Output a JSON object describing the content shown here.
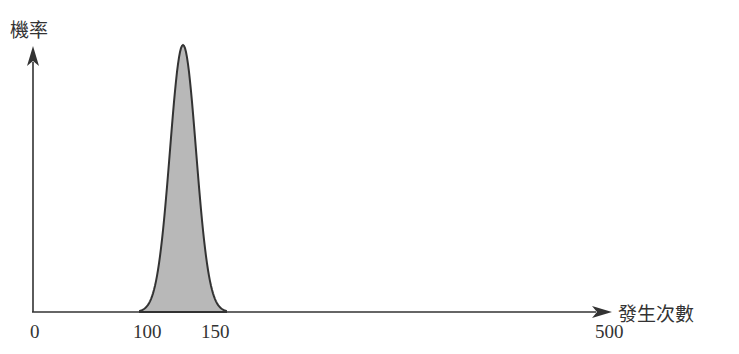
{
  "chart_data": {
    "type": "area",
    "title": "",
    "xlabel": "發生次數",
    "ylabel": "機率",
    "x_ticks": [
      "0",
      "100",
      "150",
      "500"
    ],
    "xlim": [
      0,
      500
    ],
    "grid": false,
    "legend": null,
    "series": [
      {
        "name": "機率分布",
        "shape": "bell-shaped (approx. normal)",
        "peak_x": 125,
        "support": [
          100,
          150
        ],
        "fill": "#b8b8b8",
        "stroke": "#333333"
      }
    ]
  },
  "labels": {
    "y_axis": "機率",
    "x_axis": "發生次數",
    "tick_0": "0",
    "tick_100": "100",
    "tick_150": "150",
    "tick_500": "500"
  },
  "colors": {
    "axis": "#333333",
    "curve_fill": "#b8b8b8",
    "curve_stroke": "#333333"
  }
}
